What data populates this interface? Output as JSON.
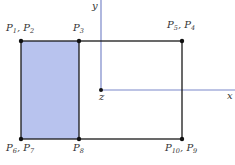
{
  "diagram": {
    "axes": {
      "y_label": "y",
      "x_label": "x",
      "origin_label": "z",
      "color": "#7b88c9"
    },
    "shaded_fill": "#b8c3ee",
    "points": {
      "top_left": {
        "label": "P",
        "sub1": "1",
        "sep": ", ",
        "label2": "P",
        "sub2": "2"
      },
      "top_mid": {
        "label": "P",
        "sub1": "3"
      },
      "top_right": {
        "label": "P",
        "sub1": "5",
        "sep": ", ",
        "label2": "P",
        "sub2": "4"
      },
      "bottom_left": {
        "label": "P",
        "sub1": "6",
        "sep": ", ",
        "label2": "P",
        "sub2": "7"
      },
      "bottom_mid": {
        "label": "P",
        "sub1": "8"
      },
      "bottom_right": {
        "label": "P",
        "sub1": "10",
        "sep": ", ",
        "label2": "P",
        "sub2": "9"
      }
    }
  }
}
